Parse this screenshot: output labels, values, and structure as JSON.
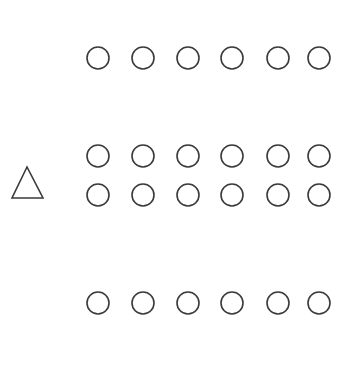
{
  "diagram": {
    "background": "#ffffff",
    "stroke_color": "#3a3a3a",
    "circle_radius": 11,
    "column_x": [
      98,
      143,
      188,
      232,
      278,
      319
    ],
    "rows": [
      {
        "name": "row-1",
        "y": 58,
        "count": 6
      },
      {
        "name": "row-2",
        "y": 156,
        "count": 6
      },
      {
        "name": "row-3",
        "y": 195,
        "count": 6
      },
      {
        "name": "row-4",
        "y": 303,
        "count": 6
      }
    ],
    "triangle": {
      "points": [
        [
          27,
          167
        ],
        [
          12,
          198
        ],
        [
          43,
          198
        ]
      ]
    }
  }
}
